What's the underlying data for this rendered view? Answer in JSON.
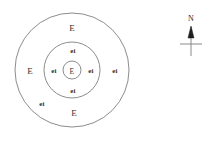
{
  "figure": {
    "type": "concentric-zone-diagram",
    "background_color": "#ffffff",
    "stroke_color": "#6e6e6e",
    "text_color": "#333333"
  },
  "circles": {
    "outer": {
      "label_name": "outer-circle",
      "cx": 72,
      "cy": 70,
      "r": 57
    },
    "middle": {
      "label_name": "middle-circle",
      "cx": 72,
      "cy": 70,
      "r": 28
    },
    "inner": {
      "label_name": "inner-circle",
      "cx": 72,
      "cy": 70,
      "r": 9
    }
  },
  "labels": {
    "outer_top": "E",
    "outer_left": "E",
    "outer_bottom": "E",
    "outer_lower_left": "ei",
    "outer_right": "ei",
    "middle_top": "ei",
    "middle_left": "ei",
    "middle_right": "ei",
    "middle_bottom": "ei",
    "center": "E"
  },
  "compass": {
    "name": "north-arrow",
    "label": "N",
    "arrow_color": "#1e1e1e",
    "axis_color": "#7d7d7d"
  }
}
